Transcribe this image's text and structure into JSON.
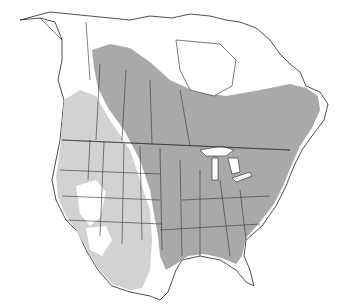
{
  "map": {
    "region": "North America",
    "type": "species range map",
    "legend": [],
    "colors": {
      "background": "#ffffff",
      "core_range": "#a9a9a9",
      "peripheral_range": "#d2d2d2",
      "borders": "#333333"
    },
    "regions_shaded": {
      "core_range": [
        "Central Canada boreal",
        "Eastern United States",
        "Great Plains",
        "Southern Ontario/Quebec",
        "Maritimes"
      ],
      "peripheral_range": [
        "Western United States",
        "Pacific Northwest",
        "Texas",
        "Rocky Mountains"
      ]
    }
  }
}
